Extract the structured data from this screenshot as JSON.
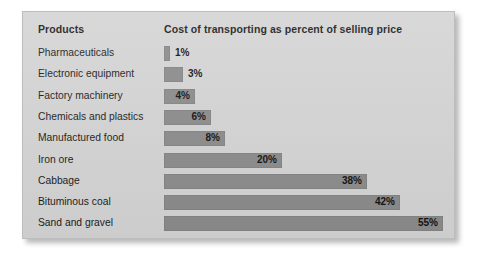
{
  "chart_data": {
    "type": "bar",
    "orientation": "horizontal",
    "title": "",
    "column_headers": {
      "category": "Products",
      "value": "Cost of transporting as percent of selling price"
    },
    "categories": [
      "Pharmaceuticals",
      "Electronic equipment",
      "Factory machinery",
      "Chemicals and plastics",
      "Manufactured food",
      "Iron ore",
      "Cabbage",
      "Bituminous coal",
      "Sand and gravel"
    ],
    "values": [
      1,
      3,
      4,
      6,
      8,
      20,
      38,
      42,
      55
    ],
    "value_labels": [
      "1%",
      "3%",
      "4%",
      "6%",
      "8%",
      "20%",
      "38%",
      "42%",
      "55%"
    ],
    "xlabel": "",
    "ylabel": "",
    "units": "percent",
    "xlim": [
      0,
      55
    ],
    "grid": false,
    "legend": false,
    "bar_color": "#8b8b8b",
    "background_color": "#d4d4d4",
    "text_color": "#1a1a1a"
  },
  "rows": [
    {
      "label": "Pharmaceuticals",
      "value_label": "1%",
      "bar_width_px": 6,
      "label_placement": "outside"
    },
    {
      "label": "Electronic equipment",
      "value_label": "3%",
      "bar_width_px": 19,
      "label_placement": "outside"
    },
    {
      "label": "Factory machinery",
      "value_label": "4%",
      "bar_width_px": 31,
      "label_placement": "inside"
    },
    {
      "label": "Chemicals and plastics",
      "value_label": "6%",
      "bar_width_px": 47,
      "label_placement": "inside"
    },
    {
      "label": "Manufactured food",
      "value_label": "8%",
      "bar_width_px": 61,
      "label_placement": "inside"
    },
    {
      "label": "Iron ore",
      "value_label": "20%",
      "bar_width_px": 118,
      "label_placement": "inside"
    },
    {
      "label": "Cabbage",
      "value_label": "38%",
      "bar_width_px": 203,
      "label_placement": "inside"
    },
    {
      "label": "Bituminous coal",
      "value_label": "42%",
      "bar_width_px": 236,
      "label_placement": "inside"
    },
    {
      "label": "Sand and gravel",
      "value_label": "55%",
      "bar_width_px": 279,
      "label_placement": "inside"
    }
  ]
}
